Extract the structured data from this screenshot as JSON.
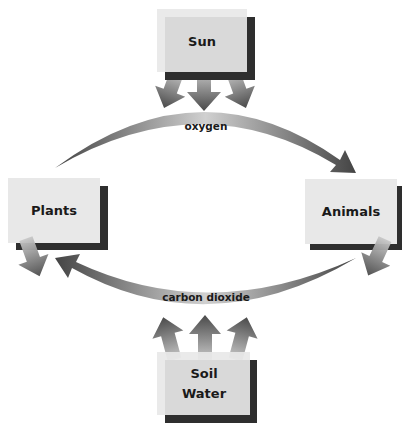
{
  "diagram": {
    "title": "",
    "colors": {
      "box_fill": "#e8e8e8",
      "box_shadow": "#2e2e2e",
      "arrow_dark": "#4a4a4a",
      "arrow_light": "#c4c4c4",
      "text": "#1a1a1a"
    },
    "nodes": {
      "sun": {
        "label": "Sun"
      },
      "plants": {
        "label": "Plants"
      },
      "animals": {
        "label": "Animals"
      },
      "soil_water": {
        "line1": "Soil",
        "line2": "Water"
      }
    },
    "edges": {
      "oxygen": {
        "label": "oxygen",
        "from": "Plants",
        "to": "Animals"
      },
      "carbon_dioxide": {
        "label": "carbon dioxide",
        "from": "Animals",
        "to": "Plants"
      },
      "sun_arrows": {
        "count": 3,
        "direction": "down",
        "from": "Sun"
      },
      "soil_arrows": {
        "count": 3,
        "direction": "up",
        "from": "Soil Water"
      },
      "plants_out": {
        "direction": "down",
        "from": "Plants"
      },
      "animals_out": {
        "direction": "down",
        "from": "Animals"
      }
    }
  }
}
